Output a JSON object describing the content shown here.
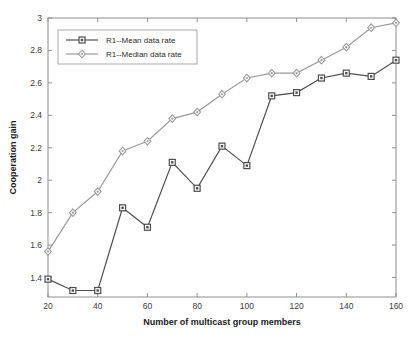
{
  "chart_data": {
    "type": "line",
    "title": "",
    "xlabel": "Number of multicast group members",
    "ylabel": "Cooperation gain",
    "x": [
      20,
      30,
      40,
      50,
      60,
      70,
      80,
      90,
      100,
      110,
      120,
      130,
      140,
      150,
      160
    ],
    "xlim": [
      20,
      160
    ],
    "ylim": [
      1.28,
      3.0
    ],
    "xticks": [
      20,
      40,
      60,
      80,
      100,
      120,
      140,
      160
    ],
    "yticks": [
      1.4,
      1.6,
      1.8,
      2,
      2.2,
      2.4,
      2.6,
      2.8,
      3
    ],
    "xtick_labels": [
      "20",
      "40",
      "60",
      "80",
      "100",
      "120",
      "140",
      "160"
    ],
    "ytick_labels": [
      "1.4",
      "1.6",
      "1.8",
      "2",
      "2.2",
      "2.4",
      "2.6",
      "2.8",
      "3"
    ],
    "grid": false,
    "legend_position": "upper left",
    "series": [
      {
        "name": "R1--Mean data rate",
        "color": "#4d4d4d",
        "marker": "square",
        "values": [
          1.39,
          1.32,
          1.32,
          1.83,
          1.71,
          2.11,
          1.95,
          2.21,
          2.09,
          2.52,
          2.54,
          2.63,
          2.66,
          2.64,
          2.74
        ]
      },
      {
        "name": "R1--Median data rate",
        "color": "#9a9a9a",
        "marker": "diamond",
        "values": [
          1.56,
          1.8,
          1.93,
          2.18,
          2.24,
          2.38,
          2.42,
          2.53,
          2.63,
          2.66,
          2.66,
          2.74,
          2.82,
          2.94,
          2.97
        ]
      }
    ]
  },
  "legend": {
    "entries": [
      {
        "label": "R1--Mean data rate"
      },
      {
        "label": "R1--Median data rate"
      }
    ]
  },
  "axes": {
    "x_title": "Number of multicast group members",
    "y_title": "Cooperation gain"
  }
}
